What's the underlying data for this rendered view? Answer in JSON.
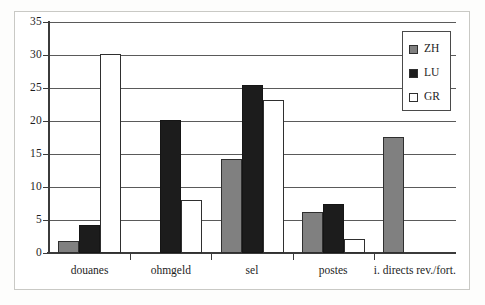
{
  "chart_data": {
    "type": "bar",
    "title": "",
    "subtitle": "",
    "xlabel": "",
    "ylabel": "",
    "ylim": [
      0,
      35
    ],
    "yticks": [
      0,
      5,
      10,
      15,
      20,
      25,
      30,
      35
    ],
    "ytick_labels": [
      "0",
      "5",
      "10",
      "15",
      "20",
      "25",
      "30",
      "35"
    ],
    "grid": true,
    "legend_position": "top-right",
    "categories": [
      "douanes",
      "ohmgeld",
      "sel",
      "postes",
      "i. directs rev./fort."
    ],
    "series": [
      {
        "name": "ZH",
        "color": "#808080",
        "values": [
          1.8,
          0,
          14.2,
          6.2,
          17.6
        ]
      },
      {
        "name": "LU",
        "color": "#1c1c1c",
        "values": [
          4.2,
          20.2,
          25.5,
          7.4,
          0
        ]
      },
      {
        "name": "GR",
        "color": "#ffffff",
        "values": [
          30.2,
          8.1,
          23.2,
          2.1,
          0
        ]
      }
    ]
  },
  "legend": {
    "items": [
      {
        "label": "ZH",
        "swatch": "zh"
      },
      {
        "label": "LU",
        "swatch": "lu"
      },
      {
        "label": "GR",
        "swatch": "gr"
      }
    ]
  },
  "colors": {
    "zh": "#808080",
    "lu": "#1c1c1c",
    "gr": "#ffffff",
    "axis": "#3b3b3b",
    "grid": "#5a5a5a",
    "frame": "#c9c9c5",
    "text": "#1d1d1d",
    "background": "#ffffff"
  }
}
